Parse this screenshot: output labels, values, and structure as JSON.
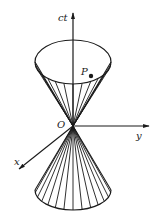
{
  "diagram": {
    "labels": {
      "time_axis": "ct",
      "y_axis": "y",
      "x_axis": "x",
      "origin": "O",
      "point": "P"
    },
    "colors": {
      "stroke": "#1a1a1a",
      "background": "#ffffff"
    },
    "upper_cone_generators": 13,
    "lower_cone_generators": 13
  }
}
